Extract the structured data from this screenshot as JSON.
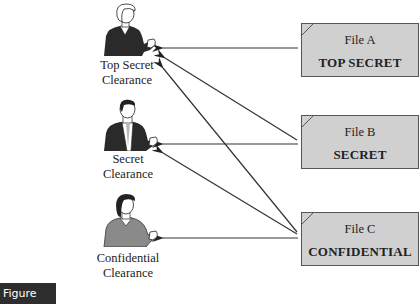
{
  "users": [
    {
      "line1": "Top Secret",
      "line2": "Clearance"
    },
    {
      "line1": "Secret",
      "line2": "Clearance"
    },
    {
      "line1": "Confidential",
      "line2": "Clearance"
    }
  ],
  "files": [
    {
      "name": "File A",
      "level": "TOP SECRET"
    },
    {
      "name": "File B",
      "level": "SECRET"
    },
    {
      "name": "File C",
      "level": "CONFIDENTIAL"
    }
  ],
  "access_arrows": [
    {
      "from": "File A",
      "to": "Top Secret Clearance"
    },
    {
      "from": "File B",
      "to": "Top Secret Clearance"
    },
    {
      "from": "File B",
      "to": "Secret Clearance"
    },
    {
      "from": "File C",
      "to": "Top Secret Clearance"
    },
    {
      "from": "File C",
      "to": "Secret Clearance"
    },
    {
      "from": "File C",
      "to": "Confidential Clearance"
    }
  ],
  "colors": {
    "file_fill": "#d0d0d0",
    "arrow": "#333333",
    "figure_label_bg": "#2d2d2d"
  },
  "figure_label": "Figure 17.3"
}
